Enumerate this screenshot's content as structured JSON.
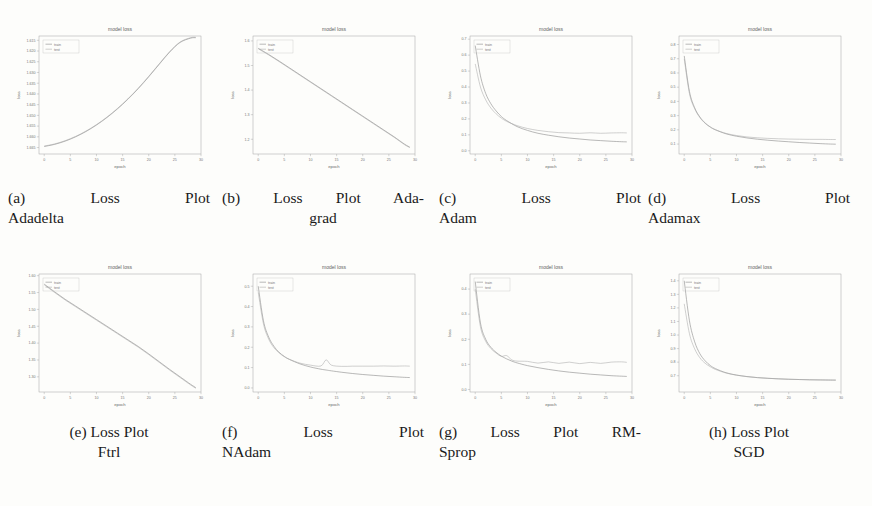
{
  "figure": {
    "layout": "4-column by 2-row grid of loss plots",
    "rows": 2,
    "columns": 4
  },
  "common": {
    "title": "model loss",
    "xlabel": "epoch",
    "ylabel": "loss",
    "legend": [
      "train",
      "test"
    ],
    "legend_position": "upper left",
    "colors": {
      "train": "#8d8d8d",
      "test": "#a9a9a9",
      "axis": "#9a9a9a",
      "page": "#fdfdfb"
    }
  },
  "captions": [
    {
      "tag": "(a)",
      "line1": "(a)  Loss  Plot",
      "line2": "Adadelta",
      "label": "Loss Plot Adadelta"
    },
    {
      "tag": "(b)",
      "line1": "(b) Loss Plot Ada-",
      "line2": "grad",
      "label": "Loss Plot Adagrad"
    },
    {
      "tag": "(c)",
      "line1": "(c)  Loss  Plot",
      "line2": "Adam",
      "label": "Loss Plot Adam"
    },
    {
      "tag": "(d)",
      "line1": "(d)  Loss  Plot",
      "line2": "Adamax",
      "label": "Loss Plot Adamax"
    },
    {
      "tag": "(e)",
      "line1": "(e) Loss Plot",
      "line2": "Ftrl",
      "label": "Loss Plot Ftrl"
    },
    {
      "tag": "(f)",
      "line1": "(f)  Loss  Plot",
      "line2": "NAdam",
      "label": "Loss Plot NAdam"
    },
    {
      "tag": "(g)",
      "line1": "(g) Loss Plot RM-",
      "line2": "Sprop",
      "label": "Loss Plot RMSprop"
    },
    {
      "tag": "(h)",
      "line1": "(h) Loss Plot",
      "line2": "SGD",
      "label": "Loss Plot SGD"
    }
  ],
  "chart_data": [
    {
      "id": "adadelta",
      "type": "line",
      "title": "model loss",
      "xlabel": "epoch",
      "ylabel": "loss",
      "legend": [
        "train",
        "test"
      ],
      "grid": false,
      "xlim": [
        -1,
        30
      ],
      "ylim": [
        1.668,
        1.613
      ],
      "xticks": [
        0,
        5,
        10,
        15,
        20,
        25,
        30
      ],
      "yticks": [
        1.615,
        1.62,
        1.625,
        1.63,
        1.635,
        1.64,
        1.645,
        1.65,
        1.655,
        1.66,
        1.665
      ],
      "ytick_labels": [
        "1.615",
        "1.620",
        "1.625",
        "1.630",
        "1.635",
        "1.640",
        "1.645",
        "1.650",
        "1.655",
        "1.660",
        "1.665"
      ],
      "x": [
        0,
        2,
        4,
        6,
        8,
        10,
        12,
        14,
        16,
        18,
        20,
        22,
        24,
        26,
        28,
        29
      ],
      "series": [
        {
          "name": "train",
          "values": [
            1.6645,
            1.6635,
            1.662,
            1.66,
            1.6575,
            1.6545,
            1.651,
            1.647,
            1.6425,
            1.6375,
            1.632,
            1.6262,
            1.6205,
            1.616,
            1.614,
            1.6138
          ]
        },
        {
          "name": "test",
          "values": [
            1.6643,
            1.6633,
            1.6618,
            1.6598,
            1.6573,
            1.6543,
            1.6508,
            1.6468,
            1.6423,
            1.6373,
            1.6318,
            1.626,
            1.6203,
            1.6158,
            1.6138,
            1.6136
          ]
        }
      ]
    },
    {
      "id": "adagrad",
      "type": "line",
      "title": "model loss",
      "xlabel": "epoch",
      "ylabel": "loss",
      "legend": [
        "train",
        "test"
      ],
      "grid": false,
      "xlim": [
        -1,
        30
      ],
      "ylim": [
        1.14,
        1.62
      ],
      "xticks": [
        0,
        5,
        10,
        15,
        20,
        25,
        30
      ],
      "yticks": [
        1.2,
        1.3,
        1.4,
        1.5,
        1.6
      ],
      "ytick_labels": [
        "1.2",
        "1.3",
        "1.4",
        "1.5",
        "1.6"
      ],
      "x": [
        0,
        2,
        4,
        6,
        8,
        10,
        12,
        14,
        16,
        18,
        20,
        22,
        24,
        26,
        28,
        29
      ],
      "series": [
        {
          "name": "train",
          "values": [
            1.57,
            1.545,
            1.518,
            1.49,
            1.462,
            1.434,
            1.406,
            1.378,
            1.35,
            1.322,
            1.294,
            1.266,
            1.238,
            1.21,
            1.18,
            1.168
          ]
        },
        {
          "name": "test",
          "values": [
            1.568,
            1.543,
            1.516,
            1.488,
            1.46,
            1.432,
            1.404,
            1.376,
            1.348,
            1.32,
            1.292,
            1.264,
            1.236,
            1.208,
            1.178,
            1.166
          ]
        }
      ]
    },
    {
      "id": "adam",
      "type": "line",
      "title": "model loss",
      "xlabel": "epoch",
      "ylabel": "loss",
      "legend": [
        "train",
        "test"
      ],
      "grid": false,
      "xlim": [
        -1,
        30
      ],
      "ylim": [
        -0.02,
        0.72
      ],
      "xticks": [
        0,
        5,
        10,
        15,
        20,
        25,
        30
      ],
      "yticks": [
        0.0,
        0.1,
        0.2,
        0.3,
        0.4,
        0.5,
        0.6,
        0.7
      ],
      "ytick_labels": [
        "0.0",
        "0.1",
        "0.2",
        "0.3",
        "0.4",
        "0.5",
        "0.6",
        "0.7"
      ],
      "x": [
        0,
        1,
        2,
        3,
        4,
        5,
        6,
        8,
        10,
        12,
        14,
        16,
        18,
        20,
        22,
        24,
        26,
        28,
        29
      ],
      "series": [
        {
          "name": "train",
          "values": [
            0.66,
            0.47,
            0.36,
            0.295,
            0.25,
            0.215,
            0.19,
            0.152,
            0.128,
            0.11,
            0.098,
            0.088,
            0.08,
            0.074,
            0.068,
            0.064,
            0.06,
            0.057,
            0.056
          ]
        },
        {
          "name": "test",
          "values": [
            0.545,
            0.4,
            0.32,
            0.268,
            0.232,
            0.205,
            0.185,
            0.158,
            0.14,
            0.128,
            0.12,
            0.114,
            0.112,
            0.11,
            0.113,
            0.11,
            0.112,
            0.113,
            0.112
          ]
        }
      ]
    },
    {
      "id": "adamax",
      "type": "line",
      "title": "model loss",
      "xlabel": "epoch",
      "ylabel": "loss",
      "legend": [
        "train",
        "test"
      ],
      "grid": false,
      "xlim": [
        -1,
        30
      ],
      "ylim": [
        0.03,
        0.86
      ],
      "xticks": [
        0,
        5,
        10,
        15,
        20,
        25,
        30
      ],
      "yticks": [
        0.1,
        0.2,
        0.3,
        0.4,
        0.5,
        0.6,
        0.7,
        0.8
      ],
      "ytick_labels": [
        "0.1",
        "0.2",
        "0.3",
        "0.4",
        "0.5",
        "0.6",
        "0.7",
        "0.8"
      ],
      "x": [
        0,
        1,
        2,
        3,
        4,
        5,
        6,
        8,
        10,
        12,
        14,
        16,
        18,
        20,
        22,
        24,
        26,
        28,
        29
      ],
      "series": [
        {
          "name": "train",
          "values": [
            0.72,
            0.47,
            0.355,
            0.29,
            0.248,
            0.22,
            0.2,
            0.172,
            0.155,
            0.143,
            0.134,
            0.127,
            0.121,
            0.116,
            0.111,
            0.107,
            0.103,
            0.1,
            0.099
          ]
        },
        {
          "name": "test",
          "values": [
            0.7,
            0.455,
            0.348,
            0.286,
            0.246,
            0.219,
            0.2,
            0.175,
            0.16,
            0.15,
            0.144,
            0.14,
            0.137,
            0.135,
            0.134,
            0.133,
            0.133,
            0.132,
            0.132
          ]
        }
      ]
    },
    {
      "id": "ftrl",
      "type": "line",
      "title": "model loss",
      "xlabel": "epoch",
      "ylabel": "loss",
      "legend": [
        "train",
        "test"
      ],
      "grid": false,
      "xlim": [
        -1,
        30
      ],
      "ylim": [
        1.255,
        1.605
      ],
      "xticks": [
        0,
        5,
        10,
        15,
        20,
        25,
        30
      ],
      "yticks": [
        1.3,
        1.35,
        1.4,
        1.45,
        1.5,
        1.55,
        1.6
      ],
      "ytick_labels": [
        "1.30",
        "1.35",
        "1.40",
        "1.45",
        "1.50",
        "1.55",
        "1.60"
      ],
      "x": [
        0,
        2,
        4,
        6,
        8,
        10,
        12,
        14,
        16,
        18,
        20,
        22,
        24,
        26,
        28,
        29
      ],
      "series": [
        {
          "name": "train",
          "values": [
            1.575,
            1.552,
            1.53,
            1.51,
            1.49,
            1.47,
            1.45,
            1.43,
            1.41,
            1.39,
            1.368,
            1.345,
            1.322,
            1.3,
            1.278,
            1.268
          ]
        },
        {
          "name": "test",
          "values": [
            1.573,
            1.55,
            1.528,
            1.508,
            1.488,
            1.468,
            1.448,
            1.428,
            1.408,
            1.388,
            1.366,
            1.343,
            1.32,
            1.298,
            1.276,
            1.266
          ]
        }
      ]
    },
    {
      "id": "nadam",
      "type": "line",
      "title": "model loss",
      "xlabel": "epoch",
      "ylabel": "loss",
      "legend": [
        "train",
        "test"
      ],
      "grid": false,
      "xlim": [
        -1,
        30
      ],
      "ylim": [
        -0.02,
        0.56
      ],
      "xticks": [
        0,
        5,
        10,
        15,
        20,
        25,
        30
      ],
      "yticks": [
        0.0,
        0.1,
        0.2,
        0.3,
        0.4,
        0.5
      ],
      "ytick_labels": [
        "0.0",
        "0.1",
        "0.2",
        "0.3",
        "0.4",
        "0.5"
      ],
      "x": [
        0,
        1,
        2,
        3,
        4,
        5,
        6,
        8,
        10,
        12,
        13,
        14,
        16,
        18,
        20,
        22,
        24,
        26,
        28,
        29
      ],
      "series": [
        {
          "name": "train",
          "values": [
            0.5,
            0.33,
            0.25,
            0.205,
            0.175,
            0.155,
            0.14,
            0.118,
            0.103,
            0.092,
            0.088,
            0.084,
            0.077,
            0.071,
            0.066,
            0.062,
            0.058,
            0.055,
            0.052,
            0.051
          ]
        },
        {
          "name": "test",
          "values": [
            0.47,
            0.315,
            0.24,
            0.198,
            0.172,
            0.153,
            0.14,
            0.122,
            0.112,
            0.108,
            0.138,
            0.112,
            0.106,
            0.107,
            0.107,
            0.107,
            0.108,
            0.107,
            0.108,
            0.107
          ]
        }
      ]
    },
    {
      "id": "rmsprop",
      "type": "line",
      "title": "model loss",
      "xlabel": "epoch",
      "ylabel": "loss",
      "legend": [
        "train",
        "test"
      ],
      "grid": false,
      "xlim": [
        -1,
        30
      ],
      "ylim": [
        -0.01,
        0.46
      ],
      "xticks": [
        0,
        5,
        10,
        15,
        20,
        25,
        30
      ],
      "yticks": [
        0.0,
        0.1,
        0.2,
        0.3,
        0.4
      ],
      "ytick_labels": [
        "0.0",
        "0.1",
        "0.2",
        "0.3",
        "0.4"
      ],
      "x": [
        0,
        1,
        2,
        3,
        4,
        5,
        6,
        7,
        8,
        10,
        12,
        14,
        16,
        18,
        20,
        22,
        24,
        26,
        28,
        29
      ],
      "series": [
        {
          "name": "train",
          "values": [
            0.43,
            0.265,
            0.2,
            0.168,
            0.148,
            0.133,
            0.122,
            0.113,
            0.106,
            0.095,
            0.087,
            0.08,
            0.074,
            0.069,
            0.065,
            0.061,
            0.058,
            0.055,
            0.053,
            0.052
          ]
        },
        {
          "name": "test",
          "values": [
            0.4,
            0.25,
            0.192,
            0.163,
            0.145,
            0.132,
            0.135,
            0.118,
            0.113,
            0.112,
            0.105,
            0.11,
            0.104,
            0.109,
            0.103,
            0.108,
            0.104,
            0.109,
            0.11,
            0.108
          ]
        }
      ]
    },
    {
      "id": "sgd",
      "type": "line",
      "title": "model loss",
      "xlabel": "epoch",
      "ylabel": "loss",
      "legend": [
        "train",
        "test"
      ],
      "grid": false,
      "xlim": [
        -1,
        30
      ],
      "ylim": [
        0.58,
        1.45
      ],
      "xticks": [
        0,
        5,
        10,
        15,
        20,
        25,
        30
      ],
      "yticks": [
        0.7,
        0.8,
        0.9,
        1.0,
        1.1,
        1.2,
        1.3,
        1.4
      ],
      "ytick_labels": [
        "0.7",
        "0.8",
        "0.9",
        "1.0",
        "1.1",
        "1.2",
        "1.3",
        "1.4"
      ],
      "x": [
        0,
        1,
        2,
        3,
        4,
        5,
        6,
        8,
        10,
        12,
        14,
        16,
        18,
        20,
        22,
        24,
        26,
        28,
        29
      ],
      "series": [
        {
          "name": "train",
          "values": [
            1.4,
            1.105,
            0.95,
            0.862,
            0.81,
            0.775,
            0.752,
            0.722,
            0.705,
            0.694,
            0.686,
            0.681,
            0.677,
            0.674,
            0.672,
            0.67,
            0.669,
            0.668,
            0.668
          ]
        },
        {
          "name": "test",
          "values": [
            1.23,
            1.01,
            0.898,
            0.832,
            0.792,
            0.766,
            0.746,
            0.72,
            0.704,
            0.693,
            0.686,
            0.681,
            0.677,
            0.674,
            0.672,
            0.67,
            0.669,
            0.668,
            0.667
          ]
        }
      ]
    }
  ]
}
